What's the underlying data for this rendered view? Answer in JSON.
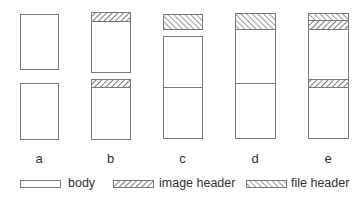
{
  "colors": {
    "stroke": "#7a7a7a",
    "hatch": "#555555",
    "text": "#333333"
  },
  "columns": [
    {
      "label": "a",
      "x": 20,
      "w": 38,
      "parts": [
        {
          "type": "body",
          "y": 14,
          "h": 55
        },
        {
          "type": "body",
          "y": 83,
          "h": 56
        }
      ]
    },
    {
      "label": "b",
      "x": 91,
      "w": 39,
      "parts": [
        {
          "type": "image-header",
          "y": 12,
          "h": 9
        },
        {
          "type": "body",
          "y": 21,
          "h": 51
        },
        {
          "type": "image-header",
          "y": 79,
          "h": 8
        },
        {
          "type": "body",
          "y": 87,
          "h": 52
        }
      ]
    },
    {
      "label": "c",
      "x": 163,
      "w": 39,
      "parts": [
        {
          "type": "file-header",
          "y": 14,
          "h": 15
        },
        {
          "type": "body",
          "y": 36,
          "h": 51
        },
        {
          "type": "body",
          "y": 87,
          "h": 51
        }
      ]
    },
    {
      "label": "d",
      "x": 235,
      "w": 40,
      "parts": [
        {
          "type": "file-header",
          "y": 13,
          "h": 16
        },
        {
          "type": "body",
          "y": 29,
          "h": 54
        },
        {
          "type": "body",
          "y": 83,
          "h": 55
        }
      ]
    },
    {
      "label": "e",
      "x": 308,
      "w": 40,
      "parts": [
        {
          "type": "file-header",
          "y": 13,
          "h": 7
        },
        {
          "type": "image-header",
          "y": 20,
          "h": 9
        },
        {
          "type": "body",
          "y": 29,
          "h": 50
        },
        {
          "type": "image-header",
          "y": 79,
          "h": 8
        },
        {
          "type": "body",
          "y": 87,
          "h": 51
        }
      ]
    }
  ],
  "labels_y": 151,
  "legend": [
    {
      "type": "body",
      "label": "body"
    },
    {
      "type": "image-header",
      "label": "image header"
    },
    {
      "type": "file-header",
      "label": "file header"
    }
  ]
}
